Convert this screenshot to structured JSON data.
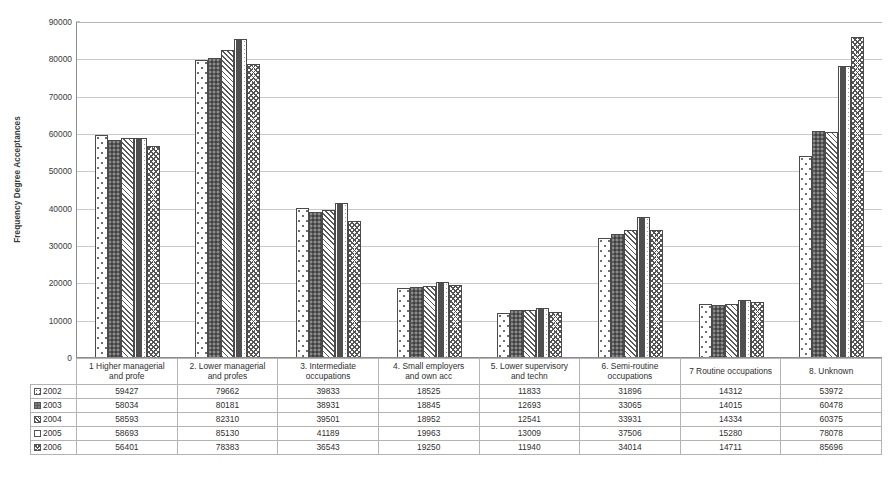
{
  "chart_data": {
    "type": "bar",
    "title": "",
    "subtitle": "",
    "xlabel": "",
    "ylabel": "Frequency Degree Acceptances",
    "ylim": [
      0,
      90000
    ],
    "ytick_labels": [
      "0",
      "10000",
      "20000",
      "30000",
      "40000",
      "50000",
      "60000",
      "70000",
      "80000",
      "90000"
    ],
    "ytick_values": [
      0,
      10000,
      20000,
      30000,
      40000,
      50000,
      60000,
      70000,
      80000,
      90000
    ],
    "grid": true,
    "legend_position": "data-table-left",
    "categories": [
      "1. Higher managerial and profe",
      "2. Lower managerial and profes",
      "3. Intermediate occupations",
      "4. Small employers and own acc",
      "5. Lower supervisory and techn",
      "6. Semi-routine occupations",
      "7. Routine occupations",
      "8. Unknown"
    ],
    "series": [
      {
        "name": "2002",
        "pattern": "sparse-dots",
        "values": [
          59427,
          79662,
          39833,
          18525,
          11833,
          31896,
          14312,
          53972
        ]
      },
      {
        "name": "2003",
        "pattern": "dark-fill",
        "values": [
          58034,
          80181,
          38931,
          18845,
          12693,
          33065,
          14015,
          60478
        ]
      },
      {
        "name": "2004",
        "pattern": "diagonal-hatch",
        "values": [
          58593,
          82310,
          39501,
          18952,
          12541,
          33931,
          14334,
          60375
        ]
      },
      {
        "name": "2005",
        "pattern": "horizontal-dash",
        "values": [
          58693,
          85130,
          41189,
          19963,
          13009,
          37506,
          15280,
          78078
        ]
      },
      {
        "name": "2006",
        "pattern": "zigzag",
        "values": [
          56401,
          78383,
          36543,
          19250,
          11940,
          34014,
          14711,
          85696
        ]
      }
    ]
  },
  "table": {
    "corner_label": "",
    "column_headers": [
      "1  Higher managerial\nand profe",
      "2. Lower managerial\nand profes",
      "3. Intermediate\noccupations",
      "4. Small employers\nand own acc",
      "5. Lower supervisory\nand techn",
      "6. Semi-routine\noccupations",
      "7  Routine occupations",
      "8. Unknown"
    ],
    "rows": [
      {
        "label": "2002",
        "values": [
          "59427",
          "79662",
          "39833",
          "18525",
          "11833",
          "31896",
          "14312",
          "53972"
        ]
      },
      {
        "label": "2003",
        "values": [
          "58034",
          "80181",
          "38931",
          "18845",
          "12693",
          "33065",
          "14015",
          "60478"
        ]
      },
      {
        "label": "2004",
        "values": [
          "58593",
          "82310",
          "39501",
          "18952",
          "12541",
          "33931",
          "14334",
          "60375"
        ]
      },
      {
        "label": "2005",
        "values": [
          "58693",
          "85130",
          "41189",
          "19963",
          "13009",
          "37506",
          "15280",
          "78078"
        ]
      },
      {
        "label": "2006",
        "values": [
          "56401",
          "78383",
          "36543",
          "19250",
          "11940",
          "34014",
          "14711",
          "85696"
        ]
      }
    ]
  },
  "colors": {
    "background": "#ffffff",
    "gridline": "#c9c9c9",
    "axis": "#8d8d8d",
    "text": "#2f2f2f",
    "bar_outline": "#4a4a4a",
    "series_2003_fill": "#5d5d5d"
  }
}
